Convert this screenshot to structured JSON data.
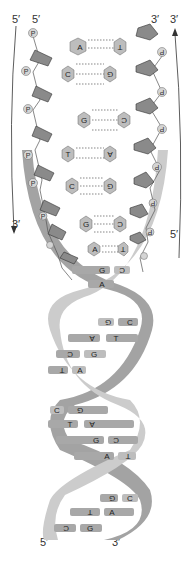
{
  "labels": {
    "top_left_outer": "5′",
    "top_left_inner": "5′",
    "top_right_inner": "3′",
    "top_right_outer": "3′",
    "mid_left": "3′",
    "mid_right": "5′",
    "bottom_left": "5′",
    "bottom_right": "3′"
  },
  "phosphate_label": "P",
  "ladder_pairs": [
    {
      "left": "A",
      "right": "T",
      "bonds": 2
    },
    {
      "left": "C",
      "right": "G",
      "bonds": 3
    },
    {
      "left": "G",
      "right": "C",
      "bonds": 3
    },
    {
      "left": "T",
      "right": "A",
      "bonds": 2
    },
    {
      "left": "C",
      "right": "G",
      "bonds": 3
    },
    {
      "left": "G",
      "right": "C",
      "bonds": 3
    },
    {
      "left": "A",
      "right": "T",
      "bonds": 2
    }
  ],
  "helix_pairs": [
    {
      "left": "G",
      "right": "C"
    },
    {
      "left": "A",
      "right": ""
    },
    {
      "left": "G",
      "right": "C"
    },
    {
      "left": "A",
      "right": "T"
    },
    {
      "left": "C",
      "right": "G"
    },
    {
      "left": "T",
      "right": "A"
    },
    {
      "left": "C",
      "right": "G"
    },
    {
      "left": "T",
      "right": "A"
    },
    {
      "left": "G",
      "right": "C"
    },
    {
      "left": "A",
      "right": "T"
    },
    {
      "left": "G",
      "right": "C"
    },
    {
      "left": "A",
      "right": "T"
    },
    {
      "left": "C",
      "right": "G"
    }
  ],
  "colors": {
    "sugar": "#8a8a8a",
    "base": "#bdbdbd",
    "phosphate": "#d4d4d4",
    "strand_light": "#c8c8c8",
    "strand_dark": "#9a9a9a",
    "line": "#444444"
  }
}
